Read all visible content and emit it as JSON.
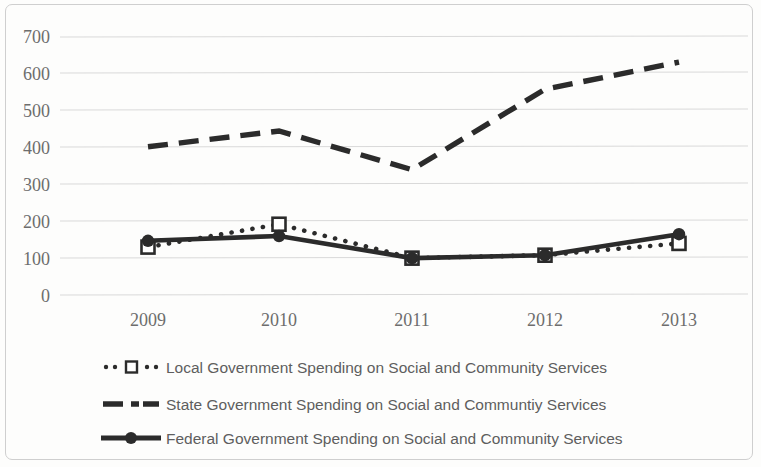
{
  "chart_data": {
    "type": "line",
    "title": "",
    "subtitle": "",
    "xlabel": "",
    "ylabel": "",
    "categories": [
      "2009",
      "2010",
      "2011",
      "2012",
      "2013"
    ],
    "x": [
      2009,
      2010,
      2011,
      2012,
      2013
    ],
    "ylim": [
      0,
      700
    ],
    "ytick_values": [
      0,
      100,
      200,
      300,
      400,
      500,
      600,
      700
    ],
    "ytick_labels": [
      "0",
      "100",
      "200",
      "300",
      "400",
      "500",
      "600",
      "700"
    ],
    "grid": true,
    "grid_axis": "y",
    "legend_position": "bottom-left",
    "series": [
      {
        "name": "Local Government Spending on Social and Community Services",
        "values": [
          130,
          192,
          100,
          108,
          140
        ],
        "style": "dotted",
        "marker": "open-square",
        "color": "#2b2b2b"
      },
      {
        "name": "State Government Spending on Social and Communtiy Services",
        "values": [
          402,
          445,
          340,
          558,
          632
        ],
        "style": "dashed",
        "marker": "none",
        "color": "#2b2b2b"
      },
      {
        "name": "Federal Government Spending on Social and Community  Services",
        "values": [
          147,
          160,
          100,
          108,
          165
        ],
        "style": "solid",
        "marker": "filled-circle",
        "color": "#2b2b2b"
      }
    ]
  },
  "legend": {
    "entries": [
      {
        "label": "Local Government Spending on Social and Community Services",
        "swatch": "dotted-open-square-swatch"
      },
      {
        "label": "State Government Spending on Social and Communtiy Services",
        "swatch": "dashed-line-swatch"
      },
      {
        "label": "Federal Government Spending on Social and Community  Services",
        "swatch": "solid-filled-circle-swatch"
      }
    ]
  },
  "colors": {
    "series": "#2b2b2b",
    "gridline": "#d9d9d9",
    "tick_text": "#6d6d6d",
    "legend_text": "#5e5e5e",
    "frame_border": "#cfcfcf",
    "background": "#fdfdfc"
  }
}
